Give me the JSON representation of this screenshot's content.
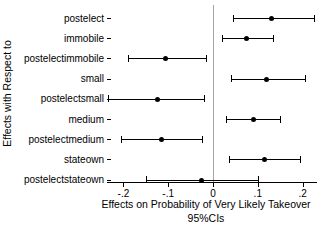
{
  "chart_data": {
    "type": "scatter",
    "subtype": "coefficient-plot-with-95-percent-ci",
    "orientation": "horizontal",
    "title": "",
    "ylabel": "Effects with Respect to",
    "xlabel": "Effects on Probability of Very Likely Takeover",
    "xlabel_sub": "95%CIs",
    "xlim": [
      -0.23,
      0.23
    ],
    "x_ticks": [
      -0.2,
      -0.1,
      0,
      0.1,
      0.2
    ],
    "x_tick_labels": [
      "-.2",
      "-.1",
      "0",
      ".1",
      ".2"
    ],
    "grid": false,
    "legend": "none",
    "reference_line_x": 0,
    "reference_line_color": "#a6a6a6",
    "marker_color": "#000000",
    "categories": [
      "postelect",
      "immobile",
      "postelectimmobile",
      "small",
      "postelectsmall",
      "medium",
      "postelectmedium",
      "stateown",
      "postelectstateown"
    ],
    "series": [
      {
        "name": "point estimate",
        "values": [
          0.13,
          0.075,
          -0.105,
          0.12,
          -0.125,
          0.09,
          -0.115,
          0.115,
          -0.025
        ],
        "ci_low": [
          0.045,
          0.02,
          -0.19,
          0.04,
          -0.235,
          0.03,
          -0.205,
          0.035,
          -0.15
        ],
        "ci_high": [
          0.225,
          0.135,
          -0.015,
          0.205,
          -0.02,
          0.15,
          -0.025,
          0.195,
          0.1
        ]
      }
    ]
  }
}
